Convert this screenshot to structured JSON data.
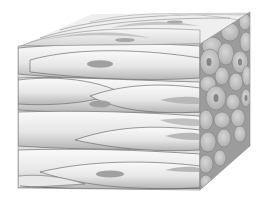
{
  "figure": {
    "colors": {
      "background": "#ffffff",
      "cell_light": "#f4f4f4",
      "cell_mid": "#d9d9d9",
      "cell_shadow": "#a8a8a8",
      "nucleus": "#9a9a9a",
      "outline": "#6e6e6e",
      "cross_section_cell": "#c9c9c9",
      "cross_section_dark": "#a5a5a5"
    }
  }
}
